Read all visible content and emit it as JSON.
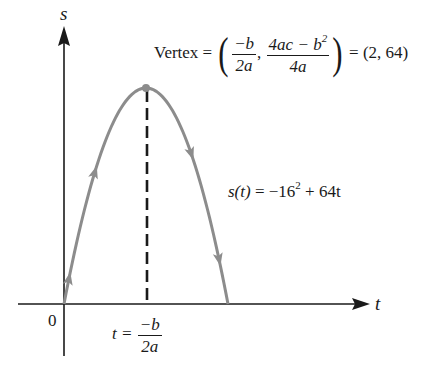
{
  "diagram": {
    "axes": {
      "y_label": "s",
      "x_label": "t",
      "origin_label": "0"
    },
    "vertex_label": {
      "prefix": "Vertex =",
      "x_num": "−b",
      "x_den": "2a",
      "y_num": "4ac − b",
      "y_num_sup": "2",
      "y_den": "4a",
      "result": "= (2, 64)"
    },
    "function_label": {
      "lhs": "s(t)",
      "rhs": "= −16",
      "sup": "2",
      "rest": "+ 64t"
    },
    "axis_of_symmetry_label": {
      "lhs": "t =",
      "num": "−b",
      "den": "2a"
    },
    "curve": {
      "a": -16,
      "b": 64,
      "c": 0,
      "t_range": [
        0,
        4
      ],
      "vertex": [
        2,
        64
      ],
      "color": "#8c8c8c"
    },
    "colors": {
      "axis": "#1a1a1a",
      "curve": "#8c8c8c",
      "dashed": "#1a1a1a"
    }
  }
}
